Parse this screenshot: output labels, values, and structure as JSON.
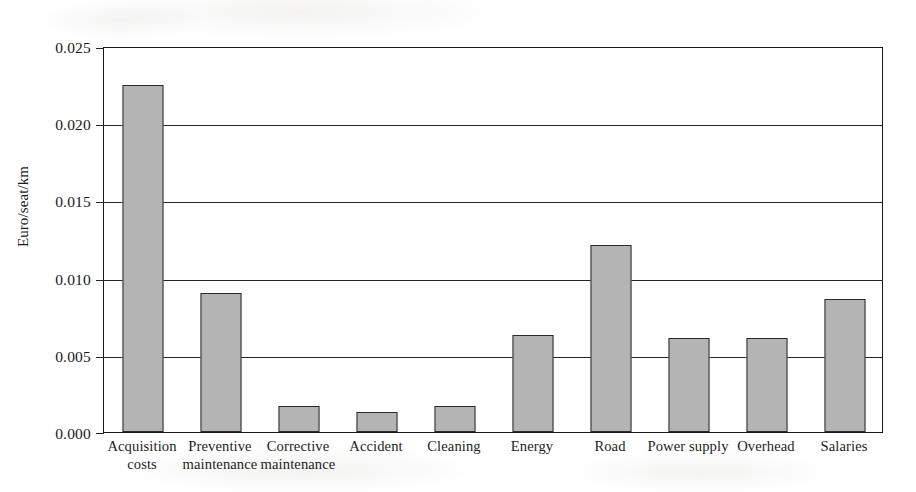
{
  "chart_data": {
    "type": "bar",
    "title": "",
    "xlabel": "",
    "ylabel": "Euro/seat/km",
    "ylim": [
      0.0,
      0.025
    ],
    "yticks": [
      "0.000",
      "0.005",
      "0.010",
      "0.015",
      "0.020",
      "0.025"
    ],
    "ytick_values": [
      0.0,
      0.005,
      0.01,
      0.015,
      0.02,
      0.025
    ],
    "grid": "horizontal",
    "legend": "none",
    "categories": [
      "Acquisition costs",
      "Preventive maintenance",
      "Corrective maintenance",
      "Accident",
      "Cleaning",
      "Energy",
      "Road",
      "Power supply",
      "Overhead",
      "Salaries"
    ],
    "category_lines": [
      [
        "Acquisition",
        "costs"
      ],
      [
        "Preventive",
        "maintenance"
      ],
      [
        "Corrective",
        "maintenance"
      ],
      [
        "Accident"
      ],
      [
        "Cleaning"
      ],
      [
        "Energy"
      ],
      [
        "Road"
      ],
      [
        "Power supply"
      ],
      [
        "Overhead"
      ],
      [
        "Salaries"
      ]
    ],
    "values": [
      0.0225,
      0.009,
      0.0017,
      0.0013,
      0.0017,
      0.0063,
      0.0121,
      0.0061,
      0.0061,
      0.0086
    ],
    "bar_color": "#b4b4b4",
    "bar_edge_color": "#2a2a2a",
    "axis_color": "#1b1b1b"
  }
}
